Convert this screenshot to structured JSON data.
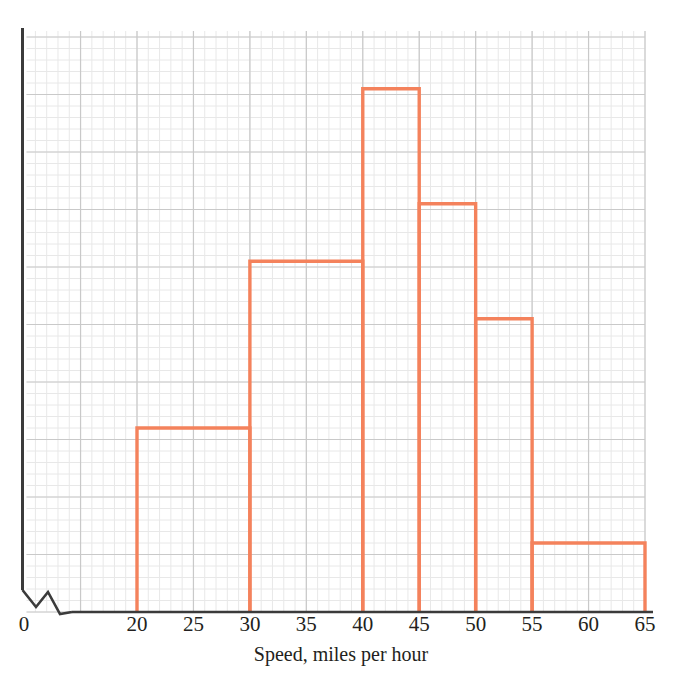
{
  "chart_data": {
    "type": "bar",
    "title": "",
    "subtitle": "",
    "xlabel": "Speed, miles per hour",
    "ylabel": "",
    "grid": true,
    "legend": null,
    "axis_break": true,
    "axis_break_note": "zigzag break on horizontal axis between 0 and 20",
    "x_origin_label": "0",
    "xlim": [
      20,
      65
    ],
    "ylim": [
      0,
      10
    ],
    "xticks": [
      20,
      25,
      30,
      35,
      40,
      45,
      50,
      55,
      60,
      65
    ],
    "xtick_labels": [
      "20",
      "25",
      "30",
      "35",
      "40",
      "45",
      "50",
      "55",
      "60",
      "65"
    ],
    "yticks": [
      0,
      1,
      2,
      3,
      4,
      5,
      6,
      7,
      8,
      9,
      10
    ],
    "ytick_labels": [],
    "bin_edges": [
      20,
      30,
      40,
      45,
      50,
      55,
      65
    ],
    "bins": [
      {
        "label": "20-30",
        "start": 20,
        "end": 30,
        "value": 3.2
      },
      {
        "label": "30-40",
        "start": 30,
        "end": 40,
        "value": 6.1
      },
      {
        "label": "40-45",
        "start": 40,
        "end": 45,
        "value": 9.1
      },
      {
        "label": "45-50",
        "start": 45,
        "end": 50,
        "value": 7.1
      },
      {
        "label": "50-55",
        "start": 50,
        "end": 55,
        "value": 5.1
      },
      {
        "label": "55-65",
        "start": 55,
        "end": 65,
        "value": 1.2
      }
    ],
    "colors": {
      "bar_outline": "#f4825c",
      "axis": "#3b3b3b",
      "grid_major": "#c9c9c9",
      "grid_minor": "#e8e8e8",
      "text": "#231f20",
      "background": "#ffffff"
    }
  }
}
